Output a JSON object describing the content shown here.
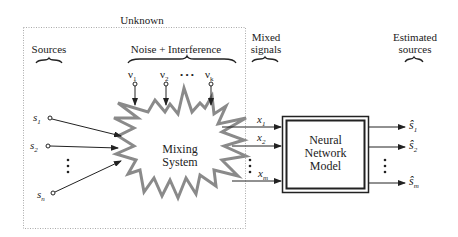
{
  "labels": {
    "unknown": "Unknown",
    "sources": "Sources",
    "noise": "Noise + Interference",
    "mixed_line1": "Mixed",
    "mixed_line2": "signals",
    "estimated_line1": "Estimated",
    "estimated_line2": "sources"
  },
  "noise_inputs": [
    {
      "symbol": "ν",
      "sub": "1"
    },
    {
      "symbol": "ν",
      "sub": "2"
    },
    {
      "symbol": "ν",
      "sub": "k"
    }
  ],
  "noise_ellipsis": "• • •",
  "sources": [
    {
      "symbol": "s",
      "sub": "1"
    },
    {
      "symbol": "s",
      "sub": "2"
    },
    {
      "symbol": "s",
      "sub": "n"
    }
  ],
  "mixed": [
    {
      "symbol": "x",
      "sub": "1"
    },
    {
      "symbol": "x",
      "sub": "2"
    },
    {
      "symbol": "x",
      "sub": "m"
    }
  ],
  "estimates": [
    {
      "symbol": "ŝ",
      "sub": "1"
    },
    {
      "symbol": "ŝ",
      "sub": "2"
    },
    {
      "symbol": "ŝ",
      "sub": "m"
    }
  ],
  "mixing_system": {
    "line1": "Mixing",
    "line2": "System"
  },
  "neural_network": {
    "line1": "Neural",
    "line2": "Network",
    "line3": "Model"
  },
  "colors": {
    "line": "#222222",
    "starburst": "#8a8a8a",
    "dotted_box": "#aaaaaa"
  }
}
